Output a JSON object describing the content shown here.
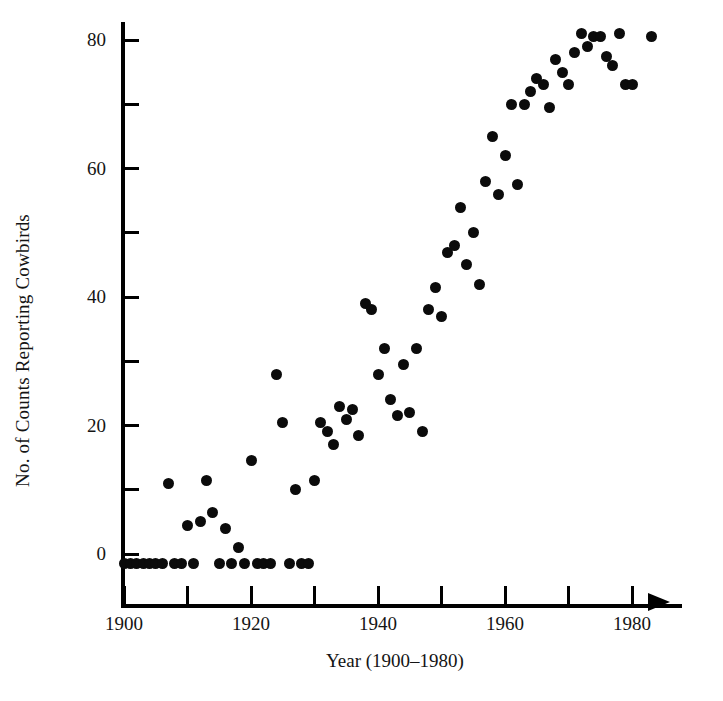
{
  "chart_data": {
    "type": "scatter",
    "title": "",
    "xlabel": "Year (1900–1980)",
    "ylabel": "No. of Counts Reporting Cowbirds",
    "xlim": [
      1897,
      1988
    ],
    "ylim": [
      -3,
      85
    ],
    "grid": false,
    "legend": null,
    "xticks": [
      1900,
      1910,
      1920,
      1930,
      1940,
      1950,
      1960,
      1970,
      1980
    ],
    "xtick_labels": [
      "1900",
      "",
      "1920",
      "",
      "1940",
      "",
      "1960",
      "",
      "1980"
    ],
    "yticks": [
      0,
      10,
      20,
      30,
      40,
      50,
      60,
      70,
      80
    ],
    "ytick_labels": [
      "0",
      "",
      "20",
      "",
      "40",
      "",
      "60",
      "",
      "80"
    ],
    "marker": "filled-circle",
    "marker_color": "#0b0b0b",
    "axis_color": "#000000",
    "x_axis_arrow": true,
    "points": [
      {
        "x": 1900,
        "y": -1.5
      },
      {
        "x": 1901,
        "y": -1.5
      },
      {
        "x": 1902,
        "y": -1.5
      },
      {
        "x": 1903,
        "y": -1.5
      },
      {
        "x": 1904,
        "y": -1.5
      },
      {
        "x": 1905,
        "y": -1.5
      },
      {
        "x": 1906,
        "y": -1.5
      },
      {
        "x": 1907,
        "y": 11
      },
      {
        "x": 1908,
        "y": -1.5
      },
      {
        "x": 1909,
        "y": -1.5
      },
      {
        "x": 1910,
        "y": 4.5
      },
      {
        "x": 1911,
        "y": -1.5
      },
      {
        "x": 1912,
        "y": 5
      },
      {
        "x": 1913,
        "y": 11.5
      },
      {
        "x": 1914,
        "y": 6.5
      },
      {
        "x": 1915,
        "y": -1.5
      },
      {
        "x": 1916,
        "y": 4
      },
      {
        "x": 1917,
        "y": -1.5
      },
      {
        "x": 1918,
        "y": 1
      },
      {
        "x": 1919,
        "y": -1.5
      },
      {
        "x": 1920,
        "y": 14.5
      },
      {
        "x": 1921,
        "y": -1.5
      },
      {
        "x": 1922,
        "y": -1.5
      },
      {
        "x": 1923,
        "y": -1.5
      },
      {
        "x": 1924,
        "y": 28
      },
      {
        "x": 1925,
        "y": 20.5
      },
      {
        "x": 1926,
        "y": -1.5
      },
      {
        "x": 1927,
        "y": 10
      },
      {
        "x": 1928,
        "y": -1.5
      },
      {
        "x": 1929,
        "y": -1.5
      },
      {
        "x": 1930,
        "y": 11.5
      },
      {
        "x": 1931,
        "y": 20.5
      },
      {
        "x": 1932,
        "y": 19
      },
      {
        "x": 1933,
        "y": 17
      },
      {
        "x": 1934,
        "y": 23
      },
      {
        "x": 1935,
        "y": 21
      },
      {
        "x": 1936,
        "y": 22.5
      },
      {
        "x": 1937,
        "y": 18.5
      },
      {
        "x": 1938,
        "y": 39
      },
      {
        "x": 1939,
        "y": 38
      },
      {
        "x": 1940,
        "y": 28
      },
      {
        "x": 1941,
        "y": 32
      },
      {
        "x": 1942,
        "y": 24
      },
      {
        "x": 1943,
        "y": 21.5
      },
      {
        "x": 1944,
        "y": 29.5
      },
      {
        "x": 1945,
        "y": 22
      },
      {
        "x": 1946,
        "y": 32
      },
      {
        "x": 1947,
        "y": 19
      },
      {
        "x": 1948,
        "y": 38
      },
      {
        "x": 1949,
        "y": 41.5
      },
      {
        "x": 1950,
        "y": 37
      },
      {
        "x": 1951,
        "y": 47
      },
      {
        "x": 1952,
        "y": 48
      },
      {
        "x": 1953,
        "y": 54
      },
      {
        "x": 1954,
        "y": 45
      },
      {
        "x": 1955,
        "y": 50
      },
      {
        "x": 1956,
        "y": 42
      },
      {
        "x": 1957,
        "y": 58
      },
      {
        "x": 1958,
        "y": 65
      },
      {
        "x": 1959,
        "y": 56
      },
      {
        "x": 1960,
        "y": 62
      },
      {
        "x": 1961,
        "y": 70
      },
      {
        "x": 1962,
        "y": 57.5
      },
      {
        "x": 1963,
        "y": 70
      },
      {
        "x": 1964,
        "y": 72
      },
      {
        "x": 1965,
        "y": 74
      },
      {
        "x": 1966,
        "y": 73
      },
      {
        "x": 1967,
        "y": 69.5
      },
      {
        "x": 1968,
        "y": 77
      },
      {
        "x": 1969,
        "y": 75
      },
      {
        "x": 1970,
        "y": 73
      },
      {
        "x": 1971,
        "y": 78
      },
      {
        "x": 1972,
        "y": 81
      },
      {
        "x": 1973,
        "y": 79
      },
      {
        "x": 1974,
        "y": 80.5
      },
      {
        "x": 1975,
        "y": 80.5
      },
      {
        "x": 1976,
        "y": 77.5
      },
      {
        "x": 1977,
        "y": 76
      },
      {
        "x": 1978,
        "y": 81
      },
      {
        "x": 1979,
        "y": 73
      },
      {
        "x": 1980,
        "y": 73
      },
      {
        "x": 1983,
        "y": 80.5
      }
    ]
  }
}
